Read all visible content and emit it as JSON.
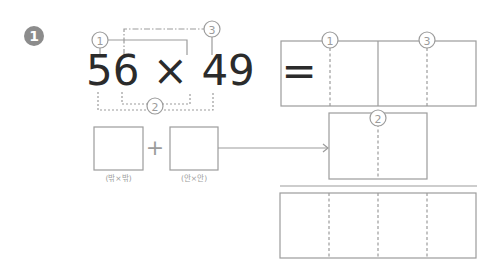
{
  "problem": {
    "number": "1",
    "equation": {
      "left_operand": "56",
      "operator": "×",
      "right_operand": "49",
      "equals": "="
    },
    "markers": {
      "m1": "1",
      "m2": "2",
      "m3": "3"
    },
    "partial_boxes": {
      "plus": "+",
      "left_label": "(밖×밖)",
      "right_label": "(안×안)"
    }
  },
  "colors": {
    "line": "#9c9c9c",
    "text": "#2b2b2b",
    "badge": "#8c8c8c"
  }
}
